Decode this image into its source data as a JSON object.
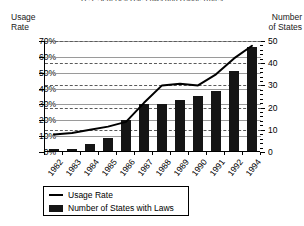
{
  "chart_data": {
    "type": "bar",
    "title": "U.S. Seat Belt Use Laws and Usage Rates",
    "xlabel": "",
    "ylabel": "Usage Rate",
    "y2label": "Number of States",
    "left_axis_caption_line1": "Usage",
    "left_axis_caption_line2": "Rate",
    "right_axis_caption_line1": "Number",
    "right_axis_caption_line2": "of States",
    "grid": true,
    "legend_position": "bottom-left",
    "categories": [
      "1982",
      "1983",
      "1984",
      "1985",
      "1986",
      "1987",
      "1988",
      "1989",
      "1990",
      "1991",
      "1992",
      "1994"
    ],
    "ylim": [
      0,
      70
    ],
    "y2lim": [
      0,
      50
    ],
    "yticks": [
      "0%",
      "10%",
      "20%",
      "30%",
      "40%",
      "50%",
      "60%",
      "70%"
    ],
    "ytick_values": [
      0,
      10,
      20,
      30,
      40,
      50,
      60,
      70
    ],
    "y2ticks": [
      "0",
      "10",
      "20",
      "30",
      "40",
      "50"
    ],
    "y2tick_values": [
      0,
      10,
      20,
      30,
      40,
      50
    ],
    "series": [
      {
        "name": "Number of States with Laws",
        "kind": "bar",
        "axis": "right",
        "color": "#151515",
        "values": [
          1,
          1,
          3,
          6,
          14,
          21,
          21,
          23,
          25,
          27,
          36,
          47
        ]
      },
      {
        "name": "Usage Rate",
        "kind": "line",
        "axis": "left",
        "color": "#000000",
        "values": [
          11,
          12,
          14,
          16,
          19,
          31,
          42,
          43,
          42,
          49,
          59,
          67
        ]
      }
    ],
    "legend": [
      {
        "label": "Usage Rate",
        "marker": "line"
      },
      {
        "label": "Number of States with Laws",
        "marker": "bar"
      }
    ]
  }
}
